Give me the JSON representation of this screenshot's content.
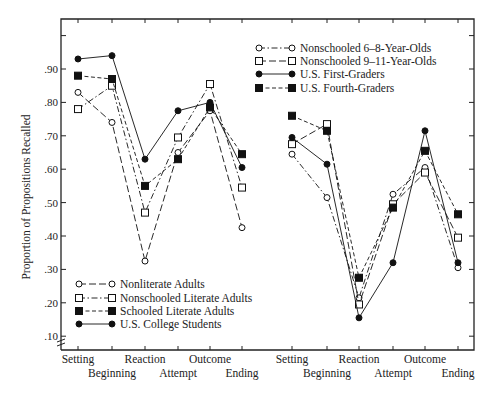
{
  "chart_data": {
    "type": "line",
    "title": "",
    "ylabel": "Proportion of Propositions Recalled",
    "xlabel": "",
    "ylim": [
      0.1,
      1.0
    ],
    "yticks": [
      0.1,
      0.2,
      0.3,
      0.4,
      0.5,
      0.6,
      0.7,
      0.8,
      0.9,
      1.0
    ],
    "ytick_labels": [
      ".10",
      ".20",
      ".30",
      ".40",
      ".50",
      ".60",
      ".70",
      ".80",
      ".90",
      ""
    ],
    "grid": false,
    "axis_break": true,
    "categories": [
      "Setting",
      "Beginning",
      "Reaction",
      "Attempt",
      "Outcome",
      "Ending"
    ],
    "panels": [
      {
        "name": "adults",
        "legend_position": "lower-left",
        "series": [
          {
            "name": "Nonliterate Adults",
            "marker": "open-circle",
            "line": "long-dash",
            "values": [
              0.83,
              0.74,
              0.325,
              0.65,
              0.775,
              0.425
            ]
          },
          {
            "name": "Nonschooled Literate Adults",
            "marker": "open-square",
            "line": "dash-dot",
            "values": [
              0.78,
              0.85,
              0.47,
              0.695,
              0.855,
              0.545
            ]
          },
          {
            "name": "Schooled Literate Adults",
            "marker": "filled-square",
            "line": "short-dash",
            "values": [
              0.88,
              0.87,
              0.55,
              0.63,
              0.785,
              0.645
            ]
          },
          {
            "name": "U.S. College Students",
            "marker": "filled-circle",
            "line": "solid",
            "values": [
              0.93,
              0.94,
              0.63,
              0.775,
              0.8,
              0.605
            ]
          }
        ]
      },
      {
        "name": "children",
        "legend_position": "upper-left",
        "series": [
          {
            "name": "Nonschooled 6–8-Year-Olds",
            "marker": "open-circle",
            "line": "dash-dot",
            "values": [
              0.645,
              0.515,
              0.215,
              0.525,
              0.605,
              0.305
            ]
          },
          {
            "name": "Nonschooled 9–11-Year-Olds",
            "marker": "open-square",
            "line": "long-dash",
            "values": [
              0.675,
              0.735,
              0.195,
              0.495,
              0.59,
              0.395
            ]
          },
          {
            "name": "U.S. First-Graders",
            "marker": "filled-circle",
            "line": "solid",
            "values": [
              0.695,
              0.615,
              0.155,
              0.32,
              0.715,
              0.32
            ]
          },
          {
            "name": "U.S. Fourth-Graders",
            "marker": "filled-square",
            "line": "short-dash",
            "values": [
              0.76,
              0.715,
              0.275,
              0.485,
              0.655,
              0.465
            ]
          }
        ]
      }
    ]
  }
}
